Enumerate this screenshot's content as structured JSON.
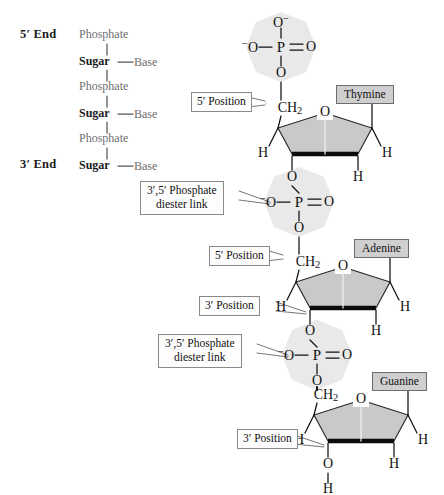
{
  "schematic": {
    "five_end_label": "5′ End",
    "three_end_label": "3′ End",
    "phosphate_label": "Phosphate",
    "sugar_label": "Sugar",
    "base_label": "Base",
    "rows": [
      {
        "kind": "phosphate",
        "text": "Phosphate"
      },
      {
        "kind": "sugar",
        "text": "Sugar",
        "base": "Base"
      },
      {
        "kind": "phosphate",
        "text": "Phosphate"
      },
      {
        "kind": "sugar",
        "text": "Sugar",
        "base": "Base"
      },
      {
        "kind": "phosphate",
        "text": "Phosphate"
      },
      {
        "kind": "sugar",
        "text": "Sugar",
        "base": "Base"
      }
    ]
  },
  "callouts": {
    "five_position_1": "5′ Position",
    "five_position_2": "5′ Position",
    "three_position_1": "3′ Position",
    "three_position_2": "3′ Position",
    "diester_1_line1": "3′,5′ Phosphate",
    "diester_1_line2": "diester link",
    "diester_2_line1": "3′,5′ Phosphate",
    "diester_2_line2": "diester link"
  },
  "bases": {
    "base_1": "Thymine",
    "base_2": "Adenine",
    "base_3": "Guanine"
  },
  "atoms": {
    "O": "O",
    "P": "P",
    "H": "H",
    "C": "C",
    "CH2": "CH",
    "CH2_sub": "2",
    "O_minus_sup": "−",
    "minus_O": "−O"
  },
  "colors": {
    "phosphate_highlight": "#e8e8e8",
    "sugar_ring_fill": "#c8c8c8",
    "base_box_fill": "#cfcfcf",
    "callout_fill": "#fdfdfd",
    "stroke": "#111111",
    "schematic_gray": "#6e6e6e"
  },
  "nucleotides": [
    {
      "index": 1,
      "base": "Thymine",
      "terminal": "phosphate",
      "has_five_position_label": true,
      "has_three_position_label": false
    },
    {
      "index": 2,
      "base": "Adenine",
      "terminal": "none",
      "has_five_position_label": true,
      "has_three_position_label": true
    },
    {
      "index": 3,
      "base": "Guanine",
      "terminal": "hydroxyl",
      "has_five_position_label": false,
      "has_three_position_label": true
    }
  ]
}
